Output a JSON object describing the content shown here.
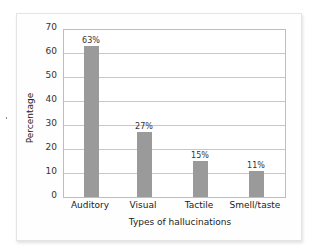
{
  "chart_data": {
    "type": "bar",
    "title": "",
    "categories": [
      "Auditory",
      "Visual",
      "Tactile",
      "Smell/taste"
    ],
    "values": [
      63,
      27,
      15,
      11
    ],
    "data_labels": [
      "63%",
      "27%",
      "15%",
      "11%"
    ],
    "xlabel": "Types of hallucinations",
    "ylabel": "Percentage",
    "ylim": [
      0,
      70
    ],
    "yticks": [
      "0",
      "10",
      "20",
      "30",
      "40",
      "50",
      "60",
      "70"
    ],
    "grid": true,
    "legend": null,
    "bar_color": "#9a9a9a"
  }
}
